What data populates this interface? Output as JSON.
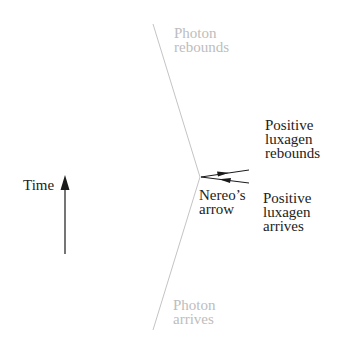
{
  "labels": {
    "photon_rebounds": "Photon\nrebounds",
    "photon_arrives": "Photon\narrives",
    "positive_rebounds": "Positive\nluxagen\nrebounds",
    "positive_arrives": "Positive\nluxagen\narrives",
    "nereos_arrow": "Nereo’s\narrow",
    "time": "Time"
  },
  "colors": {
    "photon_line": "#c4c4c4",
    "photon_text": "#bdbdbd",
    "arrow": "#1a1a1a",
    "text": "#222222"
  }
}
